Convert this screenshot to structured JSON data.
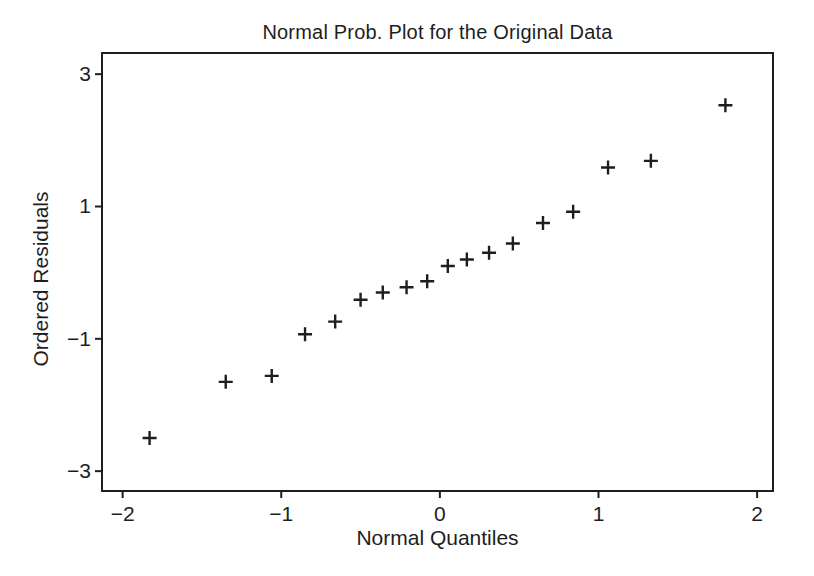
{
  "figure": {
    "background": "#ffffff",
    "ink_color": "#1e1e1e"
  },
  "chart_data": {
    "type": "scatter",
    "title": "Normal Prob. Plot for the Original Data",
    "xlabel": "Normal Quantiles",
    "ylabel": "Ordered Residuals",
    "marker": "plus",
    "marker_color": "#1e1e1e",
    "grid": false,
    "legend": "none",
    "xlim": [
      -2.13,
      2.1
    ],
    "ylim": [
      -3.3,
      3.32
    ],
    "xticks": [
      {
        "value": -2,
        "label": "−2"
      },
      {
        "value": -1,
        "label": "−1"
      },
      {
        "value": 0,
        "label": "0"
      },
      {
        "value": 1,
        "label": "1"
      },
      {
        "value": 2,
        "label": "2"
      }
    ],
    "yticks": [
      {
        "value": -3,
        "label": "−3"
      },
      {
        "value": -1,
        "label": "−1"
      },
      {
        "value": 1,
        "label": "1"
      },
      {
        "value": 3,
        "label": "3"
      }
    ],
    "points": [
      {
        "x": -1.83,
        "y": -2.5
      },
      {
        "x": -1.35,
        "y": -1.65
      },
      {
        "x": -1.06,
        "y": -1.56
      },
      {
        "x": -0.85,
        "y": -0.93
      },
      {
        "x": -0.66,
        "y": -0.74
      },
      {
        "x": -0.5,
        "y": -0.41
      },
      {
        "x": -0.36,
        "y": -0.3
      },
      {
        "x": -0.21,
        "y": -0.22
      },
      {
        "x": -0.08,
        "y": -0.13
      },
      {
        "x": 0.05,
        "y": 0.1
      },
      {
        "x": 0.17,
        "y": 0.2
      },
      {
        "x": 0.31,
        "y": 0.3
      },
      {
        "x": 0.46,
        "y": 0.44
      },
      {
        "x": 0.65,
        "y": 0.75
      },
      {
        "x": 0.84,
        "y": 0.92
      },
      {
        "x": 1.06,
        "y": 1.59
      },
      {
        "x": 1.33,
        "y": 1.69
      },
      {
        "x": 1.8,
        "y": 2.53
      }
    ]
  }
}
